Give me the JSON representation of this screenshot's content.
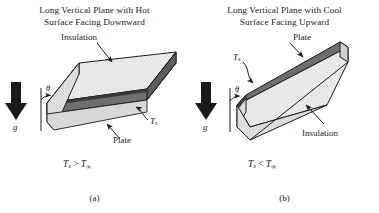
{
  "figure": {
    "background_color": "#ffffff",
    "line_color": "#1a1a1a",
    "plate_fill": "#6e6e6e",
    "insulation_fill": "#e8e8e8",
    "insulation_edge_fill": "#dcdcdc"
  },
  "panels": [
    {
      "id": "a",
      "caption": "(a)",
      "title_line1": "Long Vertical Plane with Hot",
      "title_line2": "Surface Facing Downward",
      "labels": {
        "insulation": "Insulation",
        "plate": "Plate",
        "surface_temp": "T",
        "surface_temp_sub": "s",
        "theta": "θ",
        "gravity": "g"
      },
      "condition": {
        "lhs": "T",
        "lhs_sub": "s",
        "operator": ">",
        "rhs": "T",
        "rhs_sub": "∞"
      }
    },
    {
      "id": "b",
      "caption": "(b)",
      "title_line1": "Long Vertical Plane with Cool",
      "title_line2": "Surface Facing Upward",
      "labels": {
        "insulation": "Insulation",
        "plate": "Plate",
        "surface_temp": "T",
        "surface_temp_sub": "s",
        "theta": "θ",
        "gravity": "g"
      },
      "condition": {
        "lhs": "T",
        "lhs_sub": "s",
        "operator": "<",
        "rhs": "T",
        "rhs_sub": "∞"
      }
    }
  ]
}
